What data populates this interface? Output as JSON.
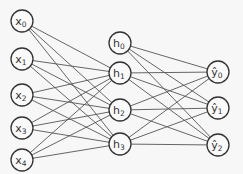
{
  "diagram": {
    "title": "",
    "layers": [
      {
        "name": "input",
        "nodes": [
          {
            "id": "x0",
            "label": "x",
            "sub": "0",
            "x": 22,
            "y": 21
          },
          {
            "id": "x1",
            "label": "x",
            "sub": "1",
            "x": 22,
            "y": 59
          },
          {
            "id": "x2",
            "label": "x",
            "sub": "2",
            "x": 22,
            "y": 95
          },
          {
            "id": "x3",
            "label": "x",
            "sub": "3",
            "x": 22,
            "y": 128
          },
          {
            "id": "x4",
            "label": "x",
            "sub": "4",
            "x": 22,
            "y": 160
          }
        ]
      },
      {
        "name": "hidden",
        "nodes": [
          {
            "id": "h0",
            "label": "h",
            "sub": "0",
            "x": 120,
            "y": 43
          },
          {
            "id": "h1",
            "label": "h",
            "sub": "1",
            "x": 120,
            "y": 73
          },
          {
            "id": "h2",
            "label": "h",
            "sub": "2",
            "x": 120,
            "y": 110
          },
          {
            "id": "h3",
            "label": "h",
            "sub": "3",
            "x": 120,
            "y": 144
          }
        ]
      },
      {
        "name": "output",
        "nodes": [
          {
            "id": "y0",
            "label": "ŷ",
            "sub": "0",
            "x": 218,
            "y": 72
          },
          {
            "id": "y1",
            "label": "ŷ",
            "sub": "1",
            "x": 218,
            "y": 108
          },
          {
            "id": "y2",
            "label": "ŷ",
            "sub": "2",
            "x": 218,
            "y": 145
          }
        ]
      }
    ],
    "edges": [
      [
        "x0",
        "h1"
      ],
      [
        "x0",
        "h2"
      ],
      [
        "x0",
        "h3"
      ],
      [
        "x1",
        "h1"
      ],
      [
        "x1",
        "h2"
      ],
      [
        "x1",
        "h3"
      ],
      [
        "x2",
        "h1"
      ],
      [
        "x2",
        "h2"
      ],
      [
        "x2",
        "h3"
      ],
      [
        "x3",
        "h1"
      ],
      [
        "x3",
        "h2"
      ],
      [
        "x3",
        "h3"
      ],
      [
        "x4",
        "h1"
      ],
      [
        "x4",
        "h2"
      ],
      [
        "x4",
        "h3"
      ],
      [
        "h0",
        "y0"
      ],
      [
        "h0",
        "y1"
      ],
      [
        "h0",
        "y2"
      ],
      [
        "h1",
        "y0"
      ],
      [
        "h1",
        "y1"
      ],
      [
        "h1",
        "y2"
      ],
      [
        "h2",
        "y0"
      ],
      [
        "h2",
        "y1"
      ],
      [
        "h2",
        "y2"
      ],
      [
        "h3",
        "y0"
      ],
      [
        "h3",
        "y1"
      ],
      [
        "h3",
        "y2"
      ]
    ],
    "node_radius": 11
  }
}
